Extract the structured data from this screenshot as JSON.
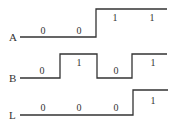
{
  "diagram": {
    "type": "timing-diagram",
    "signals": [
      {
        "name": "A",
        "values": [
          "0",
          "0",
          "1",
          "1"
        ]
      },
      {
        "name": "B",
        "values": [
          "0",
          "1",
          "0",
          "1"
        ]
      },
      {
        "name": "L",
        "values": [
          "0",
          "0",
          "0",
          "1"
        ]
      }
    ]
  }
}
